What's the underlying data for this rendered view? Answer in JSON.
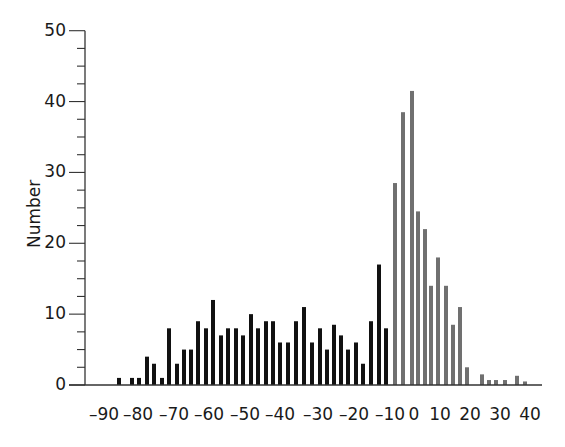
{
  "chart_data": {
    "type": "bar",
    "title": "",
    "xlabel": "",
    "ylabel": "Number",
    "ylim": [
      0,
      50
    ],
    "yticks": [
      0,
      10,
      20,
      30,
      40,
      50
    ],
    "xticks": [
      "-90",
      "-80",
      "-70",
      "-60",
      "-50",
      "-40",
      "-30",
      "-20",
      "-10",
      "0",
      "10",
      "20",
      "30",
      "40"
    ],
    "grid": false,
    "legend": null,
    "series": [
      {
        "name": "negative",
        "color": "#111111",
        "x": [
          -90,
          -86,
          -84,
          -82,
          -80,
          -78,
          -76,
          -74,
          -72,
          -70,
          -68,
          -66,
          -64,
          -62,
          -60,
          -58,
          -56,
          -54,
          -52,
          -50,
          -48,
          -46,
          -44,
          -42,
          -40,
          -38,
          -36,
          -34,
          -32,
          -30,
          -28,
          -26,
          -24,
          -22,
          -20,
          -18
        ],
        "values": [
          1,
          1,
          1,
          4,
          3,
          1,
          8,
          3,
          5,
          5,
          9,
          8,
          12,
          7,
          8,
          8,
          7,
          10,
          8,
          9,
          9,
          6,
          6,
          9,
          11,
          6,
          8,
          5,
          8.5,
          7,
          5,
          6,
          3,
          9,
          17,
          8
        ]
      },
      {
        "name": "positive",
        "color": "#707070",
        "x": [
          -10,
          -8,
          -6,
          -4,
          -2,
          0,
          2,
          4,
          6,
          8,
          10,
          14,
          16,
          18,
          22,
          26,
          28
        ],
        "values": [
          28.5,
          38.5,
          41.5,
          24.5,
          22,
          14,
          18,
          14,
          8.5,
          11,
          2.5,
          1.5,
          0.7,
          0.7,
          0.7,
          1.3,
          0.5
        ]
      }
    ],
    "bar_pixel_x": {
      "negative": [
        119,
        132,
        139,
        147,
        154,
        162,
        169,
        177,
        184,
        191,
        198,
        206,
        213,
        221,
        228,
        236,
        243,
        251,
        258,
        266,
        273,
        280,
        288,
        296,
        304,
        312,
        320,
        327,
        334,
        341,
        348,
        356,
        363,
        371,
        379,
        386
      ],
      "positive": [
        395,
        403,
        412,
        418,
        425,
        431,
        438,
        446,
        453,
        460,
        467,
        482,
        489,
        496,
        505,
        517,
        525
      ]
    },
    "xtick_pixel_x": [
      104,
      138,
      174,
      209,
      245,
      280,
      318,
      354,
      390,
      414,
      440,
      470,
      500,
      530
    ]
  }
}
